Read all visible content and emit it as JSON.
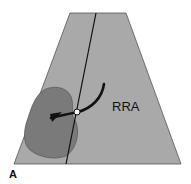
{
  "diagram": {
    "type": "ultrasound sector schematic",
    "labels": {
      "vessel": "RRA",
      "panel": "A"
    },
    "colors": {
      "sector_fill": "#a9a9a9",
      "kidney_fill": "#7a7a7a",
      "lines": "#111111",
      "marker_fill": "#ffffff"
    }
  }
}
